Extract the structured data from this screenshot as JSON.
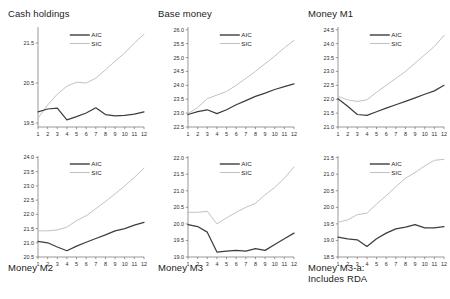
{
  "figure": {
    "width": 450,
    "height": 299,
    "background": "#ffffff",
    "aic_color": "#3d3d3d",
    "sic_color": "#c2c2c2"
  },
  "legend": {
    "aic_label": "AIC",
    "sic_label": "SIC",
    "position": "upper-left-inside"
  },
  "chart_data": [
    {
      "type": "line",
      "title": "Cash holdings",
      "title_position": "top",
      "xlabel": "",
      "ylabel": "",
      "x": [
        1,
        2,
        3,
        4,
        5,
        6,
        7,
        8,
        9,
        10,
        11,
        12
      ],
      "categories": [
        "1",
        "2",
        "3",
        "4",
        "5",
        "6",
        "7",
        "8",
        "9",
        "10",
        "11",
        "12"
      ],
      "xticklabels": [
        "1",
        "2",
        "3",
        "4",
        "5",
        "6",
        "7",
        "8",
        "9",
        "10",
        "11",
        "12"
      ],
      "yticks": [
        19.5,
        20.5,
        21.5
      ],
      "yticklabels": [
        "19.5",
        "20.5",
        "21.5"
      ],
      "ylim": [
        19.4,
        21.9
      ],
      "grid": false,
      "series": [
        {
          "name": "AIC",
          "values": [
            19.78,
            19.85,
            19.87,
            19.58,
            19.66,
            19.75,
            19.88,
            19.71,
            19.68,
            19.69,
            19.72,
            19.78
          ]
        },
        {
          "name": "SIC",
          "values": [
            19.62,
            19.95,
            20.22,
            20.42,
            20.52,
            20.5,
            20.62,
            20.83,
            21.05,
            21.25,
            21.5,
            21.72
          ]
        }
      ]
    },
    {
      "type": "line",
      "title": "Base money",
      "title_position": "top",
      "xlabel": "",
      "ylabel": "",
      "x": [
        1,
        2,
        3,
        4,
        5,
        6,
        7,
        8,
        9,
        10,
        11,
        12
      ],
      "categories": [
        "1",
        "2",
        "3",
        "4",
        "5",
        "6",
        "7",
        "8",
        "9",
        "10",
        "11",
        "12"
      ],
      "xticklabels": [
        "1",
        "2",
        "3",
        "4",
        "5",
        "6",
        "7",
        "8",
        "9",
        "10",
        "11",
        "12"
      ],
      "yticks": [
        22.5,
        23.0,
        23.5,
        24.0,
        24.5,
        25.0,
        25.5,
        26.0
      ],
      "yticklabels": [
        "22.5",
        "23.0",
        "23.5",
        "24.0",
        "24.5",
        "25.0",
        "25.5",
        "26.0"
      ],
      "ylim": [
        22.5,
        26.1
      ],
      "grid": false,
      "series": [
        {
          "name": "AIC",
          "values": [
            22.95,
            23.05,
            23.12,
            22.98,
            23.12,
            23.3,
            23.45,
            23.6,
            23.72,
            23.85,
            23.95,
            24.05
          ]
        },
        {
          "name": "SIC",
          "values": [
            22.98,
            23.2,
            23.52,
            23.65,
            23.78,
            24.0,
            24.25,
            24.5,
            24.78,
            25.05,
            25.35,
            25.62
          ]
        }
      ]
    },
    {
      "type": "line",
      "title": "Money M1",
      "title_position": "top",
      "xlabel": "",
      "ylabel": "",
      "x": [
        1,
        2,
        3,
        4,
        5,
        6,
        7,
        8,
        9,
        10,
        11,
        12
      ],
      "categories": [
        "1",
        "2",
        "3",
        "4",
        "5",
        "6",
        "7",
        "8",
        "9",
        "10",
        "11",
        "12"
      ],
      "xticklabels": [
        "1",
        "2",
        "3",
        "4",
        "5",
        "6",
        "7",
        "8",
        "9",
        "10",
        "11",
        "12"
      ],
      "yticks": [
        21.0,
        21.5,
        22.0,
        22.5,
        23.0,
        23.5,
        24.0,
        24.5
      ],
      "yticklabels": [
        "21.0",
        "21.5",
        "22.0",
        "22.5",
        "23.0",
        "23.5",
        "24.0",
        "24.5"
      ],
      "ylim": [
        21.0,
        24.6
      ],
      "grid": false,
      "series": [
        {
          "name": "AIC",
          "values": [
            22.02,
            21.75,
            21.45,
            21.42,
            21.55,
            21.68,
            21.8,
            21.92,
            22.05,
            22.18,
            22.3,
            22.5
          ]
        },
        {
          "name": "SIC",
          "values": [
            22.1,
            21.98,
            21.92,
            21.98,
            22.25,
            22.5,
            22.75,
            23.0,
            23.3,
            23.6,
            23.9,
            24.3
          ]
        }
      ]
    },
    {
      "type": "line",
      "title": "Money M2",
      "title_position": "bottom",
      "xlabel": "",
      "ylabel": "",
      "x": [
        1,
        2,
        3,
        4,
        5,
        6,
        7,
        8,
        9,
        10,
        11,
        12
      ],
      "categories": [
        "1",
        "2",
        "3",
        "4",
        "5",
        "6",
        "7",
        "8",
        "9",
        "10",
        "11",
        "12"
      ],
      "xticklabels": [
        "1",
        "2",
        "3",
        "4",
        "5",
        "6",
        "7",
        "8",
        "9",
        "10",
        "11",
        "12"
      ],
      "yticks": [
        20.5,
        21.0,
        21.5,
        22.0,
        22.5,
        23.0,
        23.5,
        24.0
      ],
      "yticklabels": [
        "20.5",
        "21.0",
        "21.5",
        "22.0",
        "22.5",
        "23.0",
        "23.5",
        "24.0"
      ],
      "ylim": [
        20.5,
        24.05
      ],
      "grid": false,
      "series": [
        {
          "name": "AIC",
          "values": [
            21.05,
            21.0,
            20.85,
            20.72,
            20.88,
            21.02,
            21.15,
            21.28,
            21.42,
            21.5,
            21.62,
            21.72
          ]
        },
        {
          "name": "SIC",
          "values": [
            21.42,
            21.42,
            21.45,
            21.55,
            21.78,
            21.95,
            22.2,
            22.45,
            22.72,
            23.0,
            23.3,
            23.62
          ]
        }
      ]
    },
    {
      "type": "line",
      "title": "Money M3",
      "title_position": "bottom",
      "xlabel": "",
      "ylabel": "",
      "x": [
        1,
        2,
        3,
        4,
        5,
        6,
        7,
        8,
        9,
        10,
        11,
        12
      ],
      "categories": [
        "1",
        "2",
        "3",
        "4",
        "5",
        "6",
        "7",
        "8",
        "9",
        "10",
        "11",
        "12"
      ],
      "xticklabels": [
        "1",
        "2",
        "3",
        "4",
        "5",
        "6",
        "7",
        "8",
        "9",
        "10",
        "11",
        "12"
      ],
      "yticks": [
        19.0,
        19.5,
        20.0,
        20.5,
        21.0,
        21.5,
        22.0
      ],
      "yticklabels": [
        "19.0",
        "19.5",
        "20.0",
        "20.5",
        "21.0",
        "21.5",
        "22.0"
      ],
      "ylim": [
        19.0,
        22.05
      ],
      "grid": false,
      "series": [
        {
          "name": "AIC",
          "values": [
            19.98,
            19.92,
            19.75,
            19.15,
            19.18,
            19.2,
            19.18,
            19.25,
            19.2,
            19.38,
            19.55,
            19.72
          ]
        },
        {
          "name": "SIC",
          "values": [
            20.35,
            20.35,
            20.38,
            20.0,
            20.18,
            20.35,
            20.5,
            20.62,
            20.88,
            21.1,
            21.38,
            21.72
          ]
        }
      ]
    },
    {
      "type": "line",
      "title": "Money M3-a:\nIncludes RDA",
      "title_position": "bottom",
      "xlabel": "",
      "ylabel": "",
      "x": [
        1,
        2,
        3,
        4,
        5,
        6,
        7,
        8,
        9,
        10,
        11,
        12
      ],
      "categories": [
        "1",
        "2",
        "3",
        "4",
        "5",
        "6",
        "7",
        "8",
        "9",
        "10",
        "11",
        "12"
      ],
      "xticklabels": [
        "1",
        "2",
        "3",
        "4",
        "5",
        "6",
        "7",
        "8",
        "9",
        "10",
        "11",
        "12"
      ],
      "yticks": [
        18.5,
        19.0,
        19.5,
        20.0,
        20.5,
        21.0,
        21.5
      ],
      "yticklabels": [
        "18.5",
        "19.0",
        "19.5",
        "20.0",
        "20.5",
        "21.0",
        "21.5"
      ],
      "ylim": [
        18.5,
        21.55
      ],
      "grid": false,
      "series": [
        {
          "name": "AIC",
          "values": [
            19.1,
            19.05,
            19.02,
            18.82,
            19.05,
            19.22,
            19.35,
            19.4,
            19.48,
            19.38,
            19.38,
            19.42
          ]
        },
        {
          "name": "SIC",
          "values": [
            19.55,
            19.62,
            19.78,
            19.82,
            20.1,
            20.35,
            20.62,
            20.88,
            21.05,
            21.25,
            21.42,
            21.45
          ]
        }
      ]
    }
  ]
}
